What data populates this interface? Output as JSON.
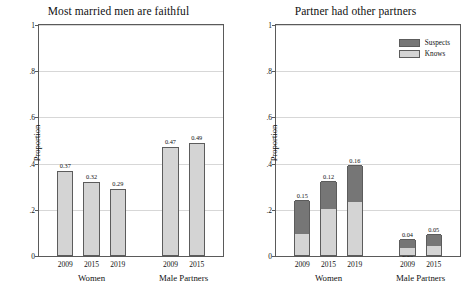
{
  "figure": {
    "width": 474,
    "height": 301,
    "background": "#ffffff"
  },
  "colors": {
    "knows": "#d4d4d4",
    "suspects": "#767676",
    "axis": "#5a5a5a",
    "grid": "#d7d7d7",
    "text": "#111111"
  },
  "chart_data": [
    {
      "type": "bar",
      "title": "Most married men are faithful",
      "xlabel": "",
      "ylabel": "Proportion",
      "ylim": [
        0,
        1
      ],
      "yticks": [
        "0",
        ".2",
        ".4",
        ".6",
        ".8",
        "1"
      ],
      "ytick_values": [
        0,
        0.2,
        0.4,
        0.6,
        0.8,
        1
      ],
      "grid": true,
      "legend": null,
      "groups": [
        {
          "label": "Women",
          "categories": [
            "2009",
            "2015",
            "2019"
          ],
          "values": [
            0.37,
            0.32,
            0.29
          ],
          "labels": [
            "0.37",
            "0.32",
            "0.29"
          ]
        },
        {
          "label": "Male Partners",
          "categories": [
            "2009",
            "2015"
          ],
          "values": [
            0.47,
            0.49
          ],
          "labels": [
            "0.47",
            "0.49"
          ]
        }
      ]
    },
    {
      "type": "bar",
      "stacked": true,
      "title": "Partner had other partners",
      "xlabel": "",
      "ylabel": "Proportion",
      "ylim": [
        0,
        1
      ],
      "yticks": [
        "0",
        ".2",
        ".4",
        ".6",
        ".8",
        "1"
      ],
      "ytick_values": [
        0,
        0.2,
        0.4,
        0.6,
        0.8,
        1
      ],
      "grid": true,
      "legend": {
        "position": "top-right",
        "entries": [
          {
            "name": "Suspects",
            "color": "#767676"
          },
          {
            "name": "Knows",
            "color": "#d4d4d4"
          }
        ]
      },
      "series": [
        {
          "name": "Knows",
          "color": "#d4d4d4"
        },
        {
          "name": "Suspects",
          "color": "#767676"
        }
      ],
      "groups": [
        {
          "label": "Women",
          "categories": [
            "2009",
            "2015",
            "2019"
          ],
          "knows": [
            0.09,
            0.2,
            0.23
          ],
          "suspects": [
            0.15,
            0.12,
            0.16
          ],
          "knows_labels": [
            "0.09",
            "0.20",
            "0.23"
          ],
          "suspects_labels": [
            "0.15",
            "0.12",
            "0.16"
          ]
        },
        {
          "label": "Male Partners",
          "categories": [
            "2009",
            "2015"
          ],
          "knows": [
            0.03,
            0.04
          ],
          "suspects": [
            0.04,
            0.05
          ],
          "knows_labels": [
            "0.03",
            "0.04"
          ],
          "suspects_labels": [
            "0.04",
            "0.05"
          ]
        }
      ]
    }
  ]
}
